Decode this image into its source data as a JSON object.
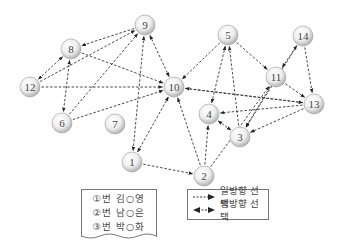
{
  "nodes": [
    {
      "id": "1",
      "label": "1"
    },
    {
      "id": "2",
      "label": "2"
    },
    {
      "id": "3",
      "label": "3"
    },
    {
      "id": "4",
      "label": "4"
    },
    {
      "id": "5",
      "label": "5"
    },
    {
      "id": "6",
      "label": "6"
    },
    {
      "id": "7",
      "label": "7"
    },
    {
      "id": "8",
      "label": "8"
    },
    {
      "id": "9",
      "label": "9"
    },
    {
      "id": "10",
      "label": "10"
    },
    {
      "id": "11",
      "label": "11"
    },
    {
      "id": "12",
      "label": "12"
    },
    {
      "id": "13",
      "label": "13"
    },
    {
      "id": "14",
      "label": "14"
    }
  ],
  "edges": [
    {
      "from": "9",
      "to": "8",
      "type": "one-way"
    },
    {
      "from": "8",
      "to": "12",
      "type": "mutual"
    },
    {
      "from": "8",
      "to": "6",
      "type": "mutual"
    },
    {
      "from": "8",
      "to": "10",
      "type": "one-way"
    },
    {
      "from": "12",
      "to": "9",
      "type": "one-way"
    },
    {
      "from": "12",
      "to": "10",
      "type": "one-way"
    },
    {
      "from": "6",
      "to": "9",
      "type": "one-way"
    },
    {
      "from": "6",
      "to": "10",
      "type": "one-way"
    },
    {
      "from": "9",
      "to": "10",
      "type": "mutual"
    },
    {
      "from": "9",
      "to": "1",
      "type": "mutual"
    },
    {
      "from": "10",
      "to": "1",
      "type": "mutual"
    },
    {
      "from": "1",
      "to": "2",
      "type": "one-way"
    },
    {
      "from": "2",
      "to": "10",
      "type": "one-way"
    },
    {
      "from": "2",
      "to": "4",
      "type": "one-way"
    },
    {
      "from": "2",
      "to": "11",
      "type": "one-way"
    },
    {
      "from": "5",
      "to": "10",
      "type": "one-way"
    },
    {
      "from": "5",
      "to": "4",
      "type": "mutual"
    },
    {
      "from": "5",
      "to": "11",
      "type": "one-way"
    },
    {
      "from": "3",
      "to": "5",
      "type": "one-way"
    },
    {
      "from": "13",
      "to": "10",
      "type": "one-way"
    },
    {
      "from": "13",
      "to": "4",
      "type": "one-way"
    },
    {
      "from": "4",
      "to": "3",
      "type": "mutual"
    },
    {
      "from": "11",
      "to": "3",
      "type": "one-way"
    },
    {
      "from": "11",
      "to": "13",
      "type": "one-way"
    },
    {
      "from": "11",
      "to": "14",
      "type": "mutual"
    },
    {
      "from": "14",
      "to": "3",
      "type": "one-way"
    },
    {
      "from": "14",
      "to": "13",
      "type": "one-way"
    },
    {
      "from": "13",
      "to": "3",
      "type": "one-way"
    },
    {
      "from": "10",
      "to": "13",
      "type": "one-way"
    }
  ],
  "names_legend": [
    "①번 김○영",
    "②번 남○은",
    "③번 박○화"
  ],
  "edge_legend": {
    "one_way": "일방향 선택",
    "mutual": "쌍방향 선택"
  },
  "colors": {
    "line": "#333333",
    "node_fill_light": "#ffffff",
    "node_fill_dark": "#b9b9b9",
    "node_text": "#444444"
  }
}
